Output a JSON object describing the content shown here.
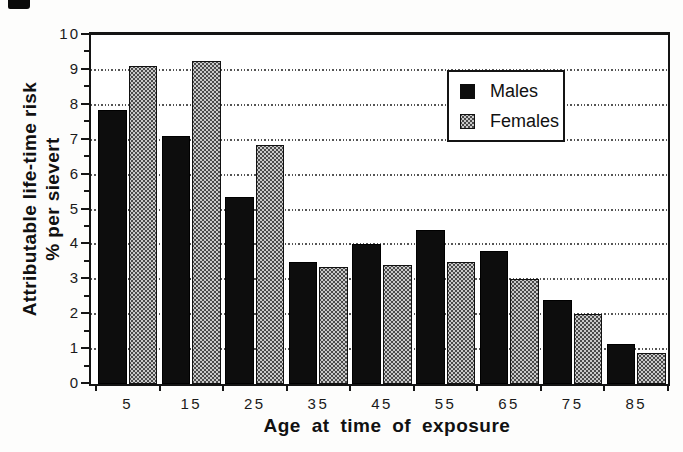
{
  "figure": {
    "background": "#ffffff",
    "frame_color": "#141414"
  },
  "chart_data": {
    "type": "bar",
    "title": "",
    "xlabel": "Age at time of exposure",
    "ylabel_line1": "Attributable life-time risk",
    "ylabel_line2": "% per sievert",
    "categories": [
      "5",
      "15",
      "25",
      "35",
      "45",
      "55",
      "65",
      "75",
      "85"
    ],
    "series": [
      {
        "name": "Males",
        "color": "#0d0d0d",
        "pattern": "solid",
        "values": [
          7.85,
          7.1,
          5.35,
          3.5,
          4.0,
          4.4,
          3.8,
          2.4,
          1.15
        ]
      },
      {
        "name": "Females",
        "color": "#9e9e9e",
        "pattern": "gray-halftone-dots",
        "values": [
          9.1,
          9.25,
          6.85,
          3.35,
          3.4,
          3.5,
          3.0,
          2.0,
          0.9
        ]
      }
    ],
    "ylim": [
      0,
      10
    ],
    "y_ticks": [
      0,
      1,
      2,
      3,
      4,
      5,
      6,
      7,
      8,
      9,
      10
    ],
    "y_minor_tick_step": 0.5,
    "gridlines": {
      "values": [
        1,
        2,
        3,
        4,
        5,
        6,
        7,
        8,
        9
      ],
      "style": "dotted",
      "orientation": "horizontal"
    },
    "legend": {
      "position": "upper-right-inside",
      "entries": [
        "Males",
        "Females"
      ]
    }
  }
}
